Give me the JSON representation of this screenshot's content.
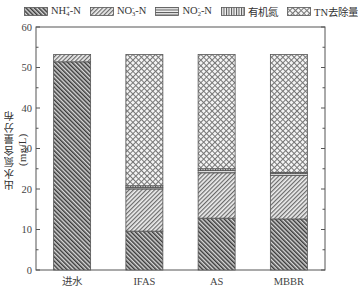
{
  "chart_data": {
    "type": "bar",
    "stacked": true,
    "title": "",
    "xlabel": "",
    "ylabel": "出水氮含量分布(mg/L)",
    "ylim": [
      0,
      60
    ],
    "yticks": [
      0,
      10,
      20,
      30,
      40,
      50,
      60
    ],
    "grid": false,
    "legend_position": "top",
    "categories": [
      "进水",
      "IFAS",
      "AS",
      "MBBR"
    ],
    "series": [
      {
        "name": "NH4+-N",
        "pattern": "backslash-hatch",
        "values": [
          51.4,
          9.6,
          12.8,
          12.6
        ]
      },
      {
        "name": "NO3--N",
        "pattern": "slash-hatch",
        "values": [
          1.8,
          10.4,
          11.2,
          10.8
        ]
      },
      {
        "name": "NO2--N",
        "pattern": "horizontal-lines",
        "values": [
          0,
          0.4,
          0.6,
          0.4
        ]
      },
      {
        "name": "有机氮",
        "pattern": "vertical-lines",
        "values": [
          0,
          0.4,
          0.4,
          0.3
        ]
      },
      {
        "name": "TN去除量",
        "pattern": "crosshatch",
        "values": [
          0,
          32.4,
          28.2,
          29.1
        ]
      }
    ]
  },
  "legend": [
    {
      "base": "NH",
      "sub": "4",
      "sup": "+",
      "tail": "-N"
    },
    {
      "base": "NO",
      "sub": "3",
      "sup": "-",
      "tail": "-N"
    },
    {
      "base": "NO",
      "sub": "2",
      "sup": "-",
      "tail": "-N"
    },
    {
      "base": "有机氮",
      "sub": "",
      "sup": "",
      "tail": ""
    },
    {
      "base": "TN去除量",
      "sub": "",
      "sup": "",
      "tail": ""
    }
  ]
}
